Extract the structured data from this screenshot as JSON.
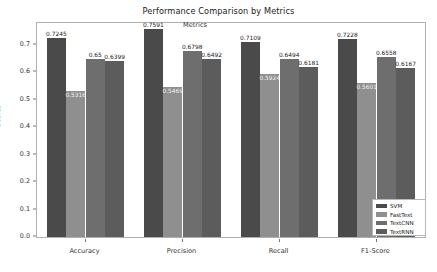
{
  "chart_data": {
    "type": "bar",
    "title": "Performance Comparison by Metrics",
    "xlabel": "Metrics",
    "ylabel": "Scores",
    "categories": [
      "Accuracy",
      "Precision",
      "Recall",
      "F1-Score"
    ],
    "ylim": [
      0.0,
      0.78
    ],
    "yticks": [
      "0.0",
      "0.1",
      "0.2",
      "0.3",
      "0.4",
      "0.5",
      "0.6",
      "0.7"
    ],
    "ytick_values": [
      0.0,
      0.1,
      0.2,
      0.3,
      0.4,
      0.5,
      0.6,
      0.7
    ],
    "grid": false,
    "legend_position": "lower right",
    "series": [
      {
        "name": "SVM",
        "color": "#4a4a4a",
        "values": [
          0.7245,
          0.7591,
          0.7109,
          0.7228
        ],
        "labels": [
          "0.7245",
          "0.7591",
          "0.7109",
          "0.7228"
        ],
        "label_placement": [
          "above",
          "above",
          "above",
          "above"
        ]
      },
      {
        "name": "FastText",
        "color": "#8f8f8f",
        "values": [
          0.5316,
          0.5469,
          0.5924,
          0.5601
        ],
        "labels": [
          "0.5316",
          "0.5469",
          "0.5924",
          "0.5601"
        ],
        "label_placement": [
          "inside",
          "inside",
          "inside",
          "inside"
        ]
      },
      {
        "name": "TextCNN",
        "color": "#6e6e6e",
        "values": [
          0.65,
          0.6798,
          0.6494,
          0.6558
        ],
        "labels": [
          "0.65",
          "0.6798",
          "0.6494",
          "0.6558"
        ],
        "label_placement": [
          "above",
          "above",
          "above",
          "above"
        ]
      },
      {
        "name": "TextRNN",
        "color": "#5c5c5c",
        "values": [
          0.6399,
          0.6492,
          0.6181,
          0.6167
        ],
        "labels": [
          "0.6399",
          "0.6492",
          "0.6181",
          "0.6167"
        ],
        "label_placement": [
          "above",
          "above",
          "above",
          "above"
        ]
      }
    ]
  },
  "legend": {
    "entries": [
      "SVM",
      "FastText",
      "TextCNN",
      "TextRNN"
    ]
  }
}
